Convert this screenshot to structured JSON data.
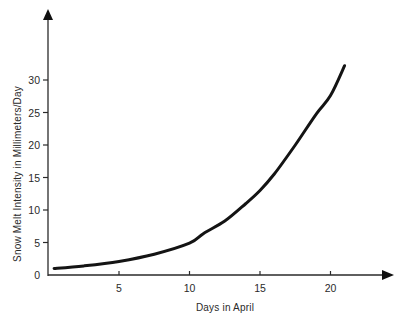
{
  "chart_data": {
    "type": "line",
    "title": "",
    "xlabel": "Days in April",
    "ylabel": "Snow Melt Intensity in Millimeters/Day",
    "x_ticks": [
      5,
      10,
      15,
      20
    ],
    "y_ticks": [
      0,
      5,
      10,
      15,
      20,
      25,
      30
    ],
    "xlim": [
      0,
      24
    ],
    "ylim": [
      0,
      37
    ],
    "grid": false,
    "legend": null,
    "series": [
      {
        "name": "Snow melt intensity",
        "x": [
          0.4,
          2.5,
          5,
          7.5,
          10,
          11,
          12.5,
          14,
          15,
          16,
          17.5,
          19,
          20,
          21
        ],
        "values": [
          1.0,
          1.4,
          2.1,
          3.2,
          4.9,
          6.4,
          8.3,
          11.0,
          13.0,
          15.5,
          20.0,
          24.8,
          27.6,
          32.2
        ]
      }
    ]
  },
  "axes": {
    "x_tick_labels": [
      "5",
      "10",
      "15",
      "20"
    ],
    "y_tick_labels": [
      "0",
      "5",
      "10",
      "15",
      "20",
      "25",
      "30"
    ]
  }
}
